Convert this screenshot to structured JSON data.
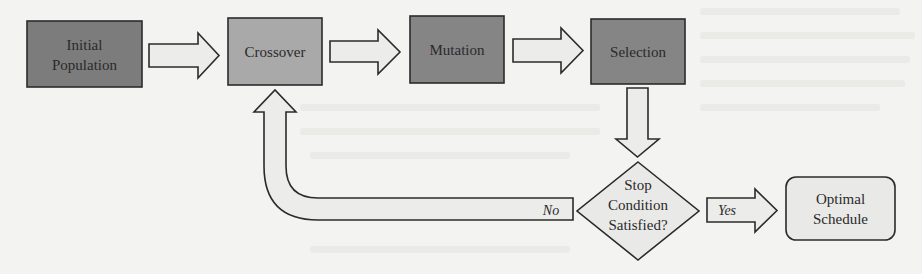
{
  "diagram": {
    "nodes": {
      "initial_population": {
        "line1": "Initial",
        "line2": "Population",
        "shape": "rectangle",
        "fill": "#7c7c7c"
      },
      "crossover": {
        "label": "Crossover",
        "shape": "rectangle",
        "fill": "#a9a9a9"
      },
      "mutation": {
        "label": "Mutation",
        "shape": "rectangle",
        "fill": "#858585"
      },
      "selection": {
        "label": "Selection",
        "shape": "rectangle",
        "fill": "#858585"
      },
      "stop_condition": {
        "line1": "Stop",
        "line2": "Condition",
        "line3": "Satisfied?",
        "shape": "diamond",
        "fill": "#e9e9e7"
      },
      "optimal_schedule": {
        "line1": "Optimal",
        "line2": "Schedule",
        "shape": "rounded-rectangle",
        "fill": "#e9e9e7"
      }
    },
    "edges": [
      {
        "from": "initial_population",
        "to": "crossover",
        "label": ""
      },
      {
        "from": "crossover",
        "to": "mutation",
        "label": ""
      },
      {
        "from": "mutation",
        "to": "selection",
        "label": ""
      },
      {
        "from": "selection",
        "to": "stop_condition",
        "label": ""
      },
      {
        "from": "stop_condition",
        "to": "crossover",
        "label": "No"
      },
      {
        "from": "stop_condition",
        "to": "optimal_schedule",
        "label": "Yes"
      }
    ],
    "edge_labels": {
      "no": "No",
      "yes": "Yes"
    },
    "colors": {
      "arrow_fill": "#ececea",
      "stroke": "#2b2b2b",
      "background": "#f3f3f1"
    }
  }
}
